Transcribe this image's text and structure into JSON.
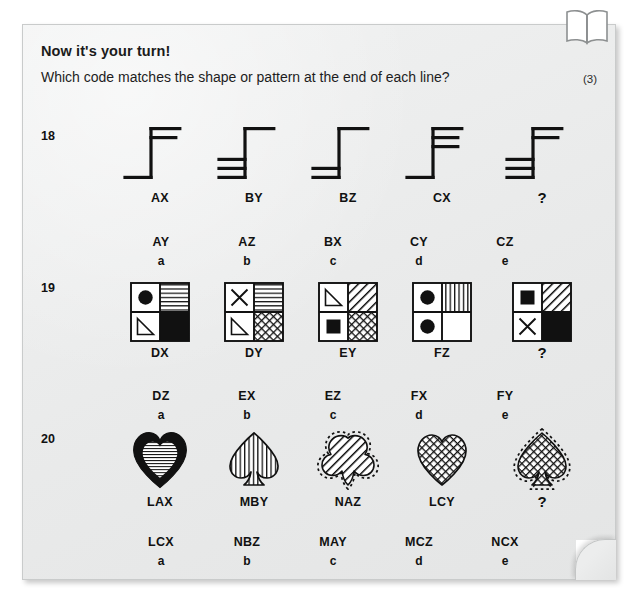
{
  "header": {
    "title": "Now it's your turn!",
    "subtitle": "Which code matches the shape or pattern at the end of each line?",
    "marks": "(3)"
  },
  "questions": [
    {
      "number": "18",
      "type": "line-code",
      "figures": [
        {
          "code": "AX",
          "top_bars": 2,
          "bottom_bars": 1
        },
        {
          "code": "BY",
          "top_bars": 1,
          "bottom_bars": 3
        },
        {
          "code": "BZ",
          "top_bars": 1,
          "bottom_bars": 2
        },
        {
          "code": "CX",
          "top_bars": 3,
          "bottom_bars": 1
        },
        {
          "code": "?",
          "top_bars": 2,
          "bottom_bars": 3
        }
      ],
      "options": [
        {
          "code": "AY",
          "letter": "a"
        },
        {
          "code": "AZ",
          "letter": "b"
        },
        {
          "code": "BX",
          "letter": "c"
        },
        {
          "code": "CY",
          "letter": "d"
        },
        {
          "code": "CZ",
          "letter": "e"
        }
      ]
    },
    {
      "number": "19",
      "type": "grid-code",
      "figures": [
        {
          "code": "DX",
          "quadrants": [
            "circle-black",
            "horizontal-lines",
            "triangle-outline",
            "solid-black"
          ]
        },
        {
          "code": "DY",
          "quadrants": [
            "cross",
            "horizontal-lines",
            "triangle-outline",
            "crosshatch"
          ]
        },
        {
          "code": "EY",
          "quadrants": [
            "triangle-outline",
            "diagonal-lines",
            "square-black",
            "crosshatch"
          ]
        },
        {
          "code": "FZ",
          "quadrants": [
            "circle-black",
            "vertical-lines",
            "circle-black",
            "blank"
          ]
        },
        {
          "code": "?",
          "quadrants": [
            "square-black",
            "diagonal-lines",
            "cross",
            "solid-black"
          ]
        }
      ],
      "options": [
        {
          "code": "DZ",
          "letter": "a"
        },
        {
          "code": "EX",
          "letter": "b"
        },
        {
          "code": "EZ",
          "letter": "c"
        },
        {
          "code": "FX",
          "letter": "d"
        },
        {
          "code": "FY",
          "letter": "e"
        }
      ]
    },
    {
      "number": "20",
      "type": "suit-code",
      "figures": [
        {
          "code": "LAX",
          "shape": "heart",
          "outline": "thick-solid",
          "fill": "horizontal-lines"
        },
        {
          "code": "MBY",
          "shape": "spade",
          "outline": "thin-solid",
          "fill": "vertical-lines"
        },
        {
          "code": "NAZ",
          "shape": "club",
          "outline": "dotted",
          "fill": "diagonal-lines"
        },
        {
          "code": "LCY",
          "shape": "heart",
          "outline": "thin-solid",
          "fill": "crosshatch"
        },
        {
          "code": "?",
          "shape": "spade",
          "outline": "dotted",
          "fill": "crosshatch"
        }
      ],
      "options": [
        {
          "code": "LCX",
          "letter": "a"
        },
        {
          "code": "NBZ",
          "letter": "b"
        },
        {
          "code": "MAY",
          "letter": "c"
        },
        {
          "code": "MCZ",
          "letter": "d"
        },
        {
          "code": "NCX",
          "letter": "e"
        }
      ]
    }
  ],
  "colors": {
    "ink": "#111111",
    "card": "#eceded",
    "page": "#ffffff"
  }
}
